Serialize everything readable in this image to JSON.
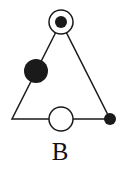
{
  "figure": {
    "label": "B",
    "colors": {
      "stroke": "#1a1a1a",
      "fill": "#1a1a1a",
      "background": "#ffffff"
    },
    "triangle": {
      "vertices": [
        {
          "name": "apex",
          "x": 61,
          "y": 22
        },
        {
          "name": "bottom-left",
          "x": 12,
          "y": 119
        },
        {
          "name": "bottom-right",
          "x": 110,
          "y": 119
        }
      ]
    },
    "markers": [
      {
        "name": "apex-ring",
        "type": "hollow",
        "cx": 61,
        "cy": 22,
        "r": 12
      },
      {
        "name": "apex-dot",
        "type": "filled",
        "cx": 61,
        "cy": 22,
        "r": 6
      },
      {
        "name": "left-edge-large-dot",
        "type": "filled",
        "cx": 36,
        "cy": 71,
        "r": 12
      },
      {
        "name": "bottom-right-dot",
        "type": "filled",
        "cx": 110,
        "cy": 119,
        "r": 6
      },
      {
        "name": "bottom-edge-ring",
        "type": "hollow",
        "cx": 61,
        "cy": 119,
        "r": 12
      }
    ]
  }
}
